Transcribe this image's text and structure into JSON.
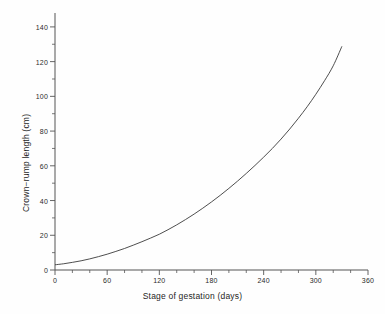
{
  "chart_data": {
    "type": "line",
    "title": "",
    "xlabel": "Stage of gestation (days)",
    "ylabel": "Crown−rump length (cm)",
    "xlim": [
      0,
      360
    ],
    "ylim": [
      0,
      148
    ],
    "grid": false,
    "legend": null,
    "x_major_ticks": [
      0,
      60,
      120,
      180,
      240,
      300,
      360
    ],
    "x_major_tick_labels": [
      "0",
      "60",
      "120",
      "180",
      "240",
      "300",
      "360"
    ],
    "x_minor_tick_interval": 20,
    "y_major_ticks": [
      0,
      20,
      40,
      60,
      80,
      100,
      120,
      140
    ],
    "y_major_tick_labels": [
      "0",
      "20",
      "40",
      "60",
      "80",
      "100",
      "120",
      "140"
    ],
    "y_minor_tick_interval": 10,
    "series": [
      {
        "name": "Crown-rump length",
        "color": "#3a3a3a",
        "x": [
          0,
          10,
          20,
          30,
          40,
          50,
          60,
          70,
          80,
          90,
          100,
          110,
          120,
          130,
          140,
          150,
          160,
          170,
          180,
          190,
          200,
          210,
          220,
          230,
          240,
          250,
          260,
          270,
          280,
          290,
          300,
          310,
          320,
          330
        ],
        "y": [
          3.0,
          3.6,
          4.4,
          5.3,
          6.4,
          7.7,
          9.1,
          10.7,
          12.4,
          14.3,
          16.3,
          18.4,
          20.6,
          23.2,
          26.0,
          29.0,
          32.2,
          35.6,
          39.2,
          43.0,
          47.0,
          51.2,
          55.6,
          60.2,
          65.0,
          70.0,
          75.4,
          81.2,
          87.4,
          94.0,
          101.2,
          109.0,
          117.6,
          128.8
        ]
      }
    ]
  },
  "axes_geometry": {
    "plot_left": 55,
    "plot_right": 368,
    "plot_top": 13,
    "plot_bottom": 270
  }
}
